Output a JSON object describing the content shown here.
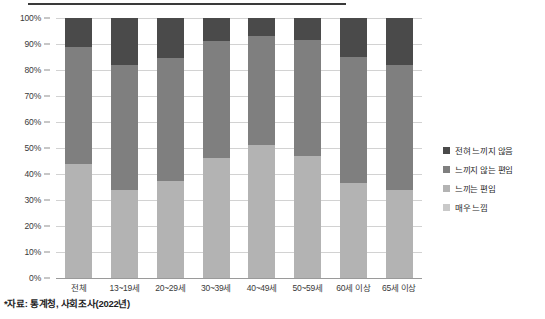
{
  "chart_data": {
    "type": "bar",
    "stacked": true,
    "stack_mode": "percent",
    "title": "",
    "xlabel": "",
    "ylabel": "",
    "ylim": [
      0,
      100
    ],
    "ytick_labels": [
      "100%",
      "90%",
      "80%",
      "70%",
      "60%",
      "50%",
      "40%",
      "30%",
      "20%",
      "10%",
      "0%"
    ],
    "ytick_values": [
      100,
      90,
      80,
      70,
      60,
      50,
      40,
      30,
      20,
      10,
      0
    ],
    "grid": true,
    "legend_position": "right",
    "categories": [
      "전체",
      "13~19세",
      "20~29세",
      "30~39세",
      "40~49세",
      "50~59세",
      "60세 이상",
      "65세 이상"
    ],
    "series": [
      {
        "name": "매우 느낌",
        "color": "#c9c9c9",
        "values": [
          0,
          0,
          0,
          0,
          0,
          0,
          0,
          0
        ]
      },
      {
        "name": "느끼는 편임",
        "color": "#b3b3b3",
        "values": [
          44.0,
          34.0,
          37.5,
          46.0,
          51.0,
          47.0,
          36.5,
          34.0
        ]
      },
      {
        "name": "느끼지 않는 편임",
        "color": "#7f7f7f",
        "values": [
          45.0,
          48.0,
          47.0,
          45.0,
          42.0,
          44.5,
          48.5,
          48.0
        ]
      },
      {
        "name": "전혀 느끼지 않음",
        "color": "#4a4a4a",
        "values": [
          11.0,
          18.0,
          15.5,
          9.0,
          7.0,
          8.5,
          15.0,
          18.0
        ]
      }
    ],
    "legend_order": [
      "전혀 느끼지 않음",
      "느끼지 않는 편임",
      "느끼는 편임",
      "매우 느낌"
    ],
    "annotations": [
      "*자료: 통계청, 사회조사(2022년)"
    ]
  },
  "footnote": "*자료: 통계청, 사회조사(2022년)"
}
